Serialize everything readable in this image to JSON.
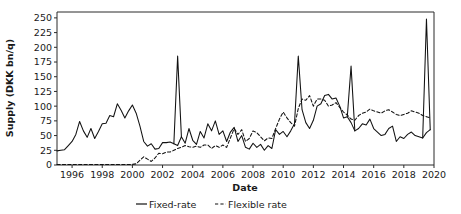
{
  "chart_data": {
    "type": "line",
    "title": "",
    "xlabel": "Date",
    "ylabel": "Supply (DKK bn/q)",
    "xlim": [
      1995.0,
      2020.0
    ],
    "ylim": [
      0,
      260
    ],
    "yticks": [
      0,
      25,
      50,
      75,
      100,
      125,
      150,
      175,
      200,
      225,
      250
    ],
    "ytick_labels": [
      "0",
      "25",
      "50",
      "75",
      "100",
      "125",
      "150",
      "175",
      "200",
      "225",
      "250"
    ],
    "xticks": [
      1996,
      1998,
      2000,
      2002,
      2004,
      2006,
      2008,
      2010,
      2012,
      2014,
      2016,
      2018,
      2020
    ],
    "xtick_labels": [
      "1996",
      "1998",
      "2000",
      "2002",
      "2004",
      "2006",
      "2008",
      "2010",
      "2012",
      "2014",
      "2016",
      "2018",
      "2020"
    ],
    "grid": false,
    "legend_position": "bottom-center",
    "x": [
      1995.0,
      1995.25,
      1995.5,
      1995.75,
      1996.0,
      1996.25,
      1996.5,
      1996.75,
      1997.0,
      1997.25,
      1997.5,
      1997.75,
      1998.0,
      1998.25,
      1998.5,
      1998.75,
      1999.0,
      1999.25,
      1999.5,
      1999.75,
      2000.0,
      2000.25,
      2000.5,
      2000.75,
      2001.0,
      2001.25,
      2001.5,
      2001.75,
      2002.0,
      2002.25,
      2002.5,
      2002.75,
      2003.0,
      2003.25,
      2003.5,
      2003.75,
      2004.0,
      2004.25,
      2004.5,
      2004.75,
      2005.0,
      2005.25,
      2005.5,
      2005.75,
      2006.0,
      2006.25,
      2006.5,
      2006.75,
      2007.0,
      2007.25,
      2007.5,
      2007.75,
      2008.0,
      2008.25,
      2008.5,
      2008.75,
      2009.0,
      2009.25,
      2009.5,
      2009.75,
      2010.0,
      2010.25,
      2010.5,
      2010.75,
      2011.0,
      2011.25,
      2011.5,
      2011.75,
      2012.0,
      2012.25,
      2012.5,
      2012.75,
      2013.0,
      2013.25,
      2013.5,
      2013.75,
      2014.0,
      2014.25,
      2014.5,
      2014.75,
      2015.0,
      2015.25,
      2015.5,
      2015.75,
      2016.0,
      2016.25,
      2016.5,
      2016.75,
      2017.0,
      2017.25,
      2017.5,
      2017.75,
      2018.0,
      2018.25,
      2018.5,
      2018.75,
      2019.0,
      2019.25,
      2019.5,
      2019.75
    ],
    "series": [
      {
        "name": "Fixed-rate",
        "style": "solid",
        "values": [
          24,
          25,
          26,
          33,
          40,
          52,
          74,
          58,
          47,
          62,
          45,
          57,
          70,
          71,
          84,
          82,
          104,
          93,
          80,
          92,
          102,
          88,
          66,
          40,
          32,
          36,
          27,
          28,
          38,
          38,
          39,
          36,
          33,
          48,
          37,
          62,
          42,
          35,
          57,
          46,
          70,
          58,
          75,
          52,
          58,
          40,
          56,
          64,
          40,
          50,
          30,
          27,
          37,
          30,
          35,
          25,
          33,
          28,
          60,
          52,
          57,
          48,
          58,
          70,
          185,
          94,
          72,
          62,
          76,
          100,
          104,
          118,
          120,
          112,
          114,
          100,
          80,
          82,
          72,
          58,
          62,
          70,
          68,
          78,
          62,
          56,
          50,
          52,
          62,
          66,
          40,
          48,
          45,
          52,
          56,
          50,
          48,
          46,
          55,
          60
        ]
      },
      {
        "name": "Flexible rate",
        "style": "dashed",
        "values": [
          1,
          1,
          1,
          1,
          1,
          1,
          1,
          1,
          1,
          1,
          1,
          1,
          1,
          1,
          1,
          1,
          1,
          1,
          1,
          1,
          1,
          2,
          8,
          14,
          10,
          6,
          12,
          20,
          19,
          22,
          22,
          25,
          28,
          30,
          33,
          31,
          30,
          32,
          30,
          34,
          34,
          28,
          33,
          30,
          34,
          30,
          46,
          62,
          52,
          60,
          40,
          45,
          58,
          55,
          48,
          41,
          46,
          45,
          62,
          78,
          90,
          80,
          72,
          66,
          96,
          112,
          110,
          118,
          100,
          112,
          112,
          110,
          100,
          102,
          106,
          98,
          90,
          85,
          78,
          76,
          84,
          88,
          90,
          95,
          92,
          90,
          88,
          92,
          94,
          90,
          86,
          84,
          86,
          88,
          92,
          90,
          88,
          84,
          82,
          80
        ]
      }
    ],
    "note_fixed_peaks": [
      {
        "x": 2003.0,
        "y": 185
      },
      {
        "x": 2014.5,
        "y": 168
      },
      {
        "x": 2019.5,
        "y": 248
      }
    ],
    "legend": [
      "Fixed-rate",
      "Flexible rate"
    ]
  },
  "colors": {
    "line": "#111111",
    "axis": "#2b2b2b",
    "background": "#ffffff",
    "text": "#1a1a1a"
  }
}
